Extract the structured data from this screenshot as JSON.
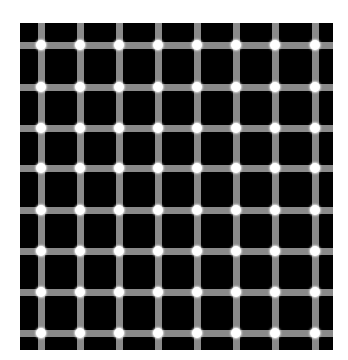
{
  "figure": {
    "name": "scintillating-grid-illusion",
    "background": "#000000",
    "line_color": "#8a8a8a",
    "dot_color": "#ffffff",
    "vertical_lines_x": [
      21,
      60,
      99,
      138,
      177,
      216,
      255,
      295
    ],
    "horizontal_lines_y": [
      22,
      64,
      105,
      145,
      187,
      228,
      269,
      310
    ]
  }
}
